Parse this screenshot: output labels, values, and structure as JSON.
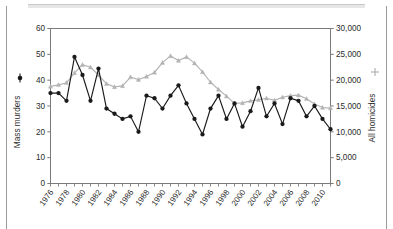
{
  "chart_data": {
    "type": "line",
    "title": "",
    "xlabel": "",
    "x": [
      1976,
      1977,
      1978,
      1979,
      1980,
      1981,
      1982,
      1983,
      1984,
      1985,
      1986,
      1987,
      1988,
      1989,
      1990,
      1991,
      1992,
      1993,
      1994,
      1995,
      1996,
      1997,
      1998,
      1999,
      2000,
      2001,
      2002,
      2003,
      2004,
      2005,
      2006,
      2007,
      2008,
      2009,
      2010,
      2011
    ],
    "xtick_labels": [
      "1976",
      "1978",
      "1980",
      "1982",
      "1984",
      "1986",
      "1988",
      "1990",
      "1992",
      "1994",
      "1996",
      "1998",
      "2000",
      "2002",
      "2004",
      "2006",
      "2008",
      "2010"
    ],
    "xtick_values": [
      1976,
      1978,
      1980,
      1982,
      1984,
      1986,
      1988,
      1990,
      1992,
      1994,
      1996,
      1998,
      2000,
      2002,
      2004,
      2006,
      2008,
      2010
    ],
    "grid": false,
    "legend_position": "axis-labels",
    "series": [
      {
        "name": "Mass murders",
        "axis": "left",
        "color": "#1a1a1a",
        "marker": "circle",
        "ylabel": "Mass murders",
        "ylim": [
          0,
          60
        ],
        "ytick_labels": [
          "0",
          "10",
          "20",
          "30",
          "40",
          "50",
          "60"
        ],
        "ytick_values": [
          0,
          10,
          20,
          30,
          40,
          50,
          60
        ],
        "values": [
          35,
          35,
          32,
          49,
          42,
          32,
          44.5,
          29,
          27,
          25,
          26,
          20,
          34,
          33,
          29,
          34,
          38,
          31,
          25,
          19,
          29,
          34,
          25,
          31,
          22,
          28,
          37,
          26,
          31,
          23,
          33,
          32,
          26,
          30,
          25,
          21
        ]
      },
      {
        "name": "All homicides",
        "axis": "right",
        "color": "#b3b3b3",
        "marker": "triangle",
        "ylabel": "All homicides",
        "ylim": [
          0,
          30000
        ],
        "ytick_labels": [
          "0",
          "5,000",
          "10,000",
          "15,000",
          "20,000",
          "25,000",
          "30,000"
        ],
        "ytick_values": [
          0,
          5000,
          10000,
          15000,
          20000,
          25000,
          30000
        ],
        "values": [
          18800,
          19100,
          19500,
          21400,
          23000,
          22500,
          21000,
          19300,
          18700,
          18900,
          20600,
          20100,
          20700,
          21500,
          23400,
          24700,
          23800,
          24500,
          23300,
          21600,
          19600,
          18200,
          16900,
          15500,
          15600,
          16000,
          16200,
          16500,
          16100,
          16700,
          17000,
          17100,
          16400,
          15400,
          14700,
          14600
        ]
      }
    ]
  },
  "axes": {
    "left_label": "Mass murders",
    "right_label": "All homicides"
  }
}
